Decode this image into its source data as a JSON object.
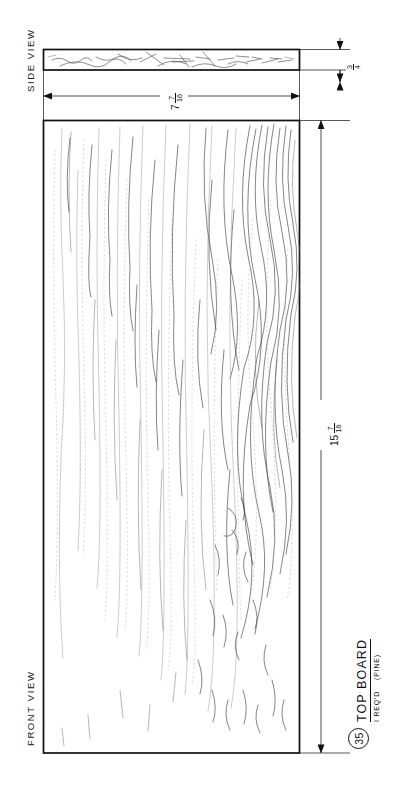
{
  "drawing": {
    "sheet_title": "TOP BOARD",
    "part_number": "35",
    "quantity_note": "I REQ'D",
    "material_note": "(PINE)",
    "views": {
      "side": "SIDE VIEW",
      "front": "FRONT VIEW"
    },
    "dimensions": [
      {
        "id": "thickness",
        "applies_to": "side-view",
        "whole": "",
        "numerator": "3",
        "denominator": "4",
        "display": "3/4",
        "orientation": "vertical-stack-rotated"
      },
      {
        "id": "width",
        "applies_to": "front-view-width",
        "whole": "7",
        "numerator": "7",
        "denominator": "16",
        "display": "7 7/16",
        "orientation": "vertical-stack-rotated"
      },
      {
        "id": "length",
        "applies_to": "front-view-length",
        "whole": "15",
        "numerator": "7",
        "denominator": "16",
        "display": "15 7/16",
        "orientation": "vertical-stack-rotated"
      }
    ],
    "colors": {
      "line": "#111111",
      "grain": "#3a3a3a",
      "paper": "#ffffff"
    },
    "icons": {
      "part_balloon": "circled-number-icon",
      "arrow_head": "dimension-arrow-icon"
    }
  }
}
